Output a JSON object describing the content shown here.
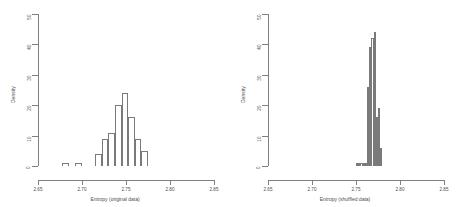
{
  "figure": {
    "background": "#ffffff",
    "line_color": "#808080",
    "bar_stroke": "#7a7a7a",
    "text_color": "#4d4d4d"
  },
  "chart_data": [
    {
      "type": "bar",
      "panel": "left",
      "title": "",
      "xlabel": "Entropy (original data)",
      "ylabel": "Density",
      "xlim": [
        2.65,
        2.85
      ],
      "ylim": [
        0,
        50
      ],
      "grid": false,
      "legend": null,
      "xticks": [
        2.65,
        2.7,
        2.75,
        2.8,
        2.85
      ],
      "xtick_labels": [
        "2.65",
        "2.70",
        "2.75",
        "2.80",
        "2.85"
      ],
      "yticks": [
        0,
        10,
        20,
        30,
        40,
        50
      ],
      "ytick_labels": [
        "0",
        "10",
        "20",
        "30",
        "40",
        "50"
      ],
      "bin_width": 0.0075,
      "bins": [
        {
          "x0": 2.6775,
          "x1": 2.685,
          "value": 1
        },
        {
          "x0": 2.6925,
          "x1": 2.7,
          "value": 1
        },
        {
          "x0": 2.715,
          "x1": 2.7225,
          "value": 4
        },
        {
          "x0": 2.7225,
          "x1": 2.73,
          "value": 9
        },
        {
          "x0": 2.73,
          "x1": 2.7375,
          "value": 11
        },
        {
          "x0": 2.7375,
          "x1": 2.745,
          "value": 20
        },
        {
          "x0": 2.745,
          "x1": 2.7525,
          "value": 24
        },
        {
          "x0": 2.7525,
          "x1": 2.76,
          "value": 16
        },
        {
          "x0": 2.76,
          "x1": 2.7675,
          "value": 9
        },
        {
          "x0": 2.7675,
          "x1": 2.775,
          "value": 5
        }
      ]
    },
    {
      "type": "bar",
      "panel": "right",
      "title": "",
      "xlabel": "Entropy (shuffled data)",
      "ylabel": "Density",
      "xlim": [
        2.65,
        2.85
      ],
      "ylim": [
        0,
        50
      ],
      "grid": false,
      "legend": null,
      "xticks": [
        2.65,
        2.7,
        2.75,
        2.8,
        2.85
      ],
      "xtick_labels": [
        "2.65",
        "2.70",
        "2.75",
        "2.80",
        "2.85"
      ],
      "yticks": [
        0,
        10,
        20,
        30,
        40,
        50
      ],
      "ytick_labels": [
        "0",
        "10",
        "20",
        "30",
        "40",
        "50"
      ],
      "bin_width": 0.0025,
      "bins": [
        {
          "x0": 2.75,
          "x1": 2.7525,
          "value": 1
        },
        {
          "x0": 2.7525,
          "x1": 2.755,
          "value": 1
        },
        {
          "x0": 2.755,
          "x1": 2.7575,
          "value": 1
        },
        {
          "x0": 2.7575,
          "x1": 2.76,
          "value": 1
        },
        {
          "x0": 2.76,
          "x1": 2.7625,
          "value": 1
        },
        {
          "x0": 2.7625,
          "x1": 2.765,
          "value": 26
        },
        {
          "x0": 2.765,
          "x1": 2.7675,
          "value": 39
        },
        {
          "x0": 2.7675,
          "x1": 2.77,
          "value": 42
        },
        {
          "x0": 2.77,
          "x1": 2.7725,
          "value": 44
        },
        {
          "x0": 2.7725,
          "x1": 2.775,
          "value": 16
        },
        {
          "x0": 2.775,
          "x1": 2.7775,
          "value": 19
        },
        {
          "x0": 2.7775,
          "x1": 2.78,
          "value": 6
        }
      ]
    }
  ]
}
